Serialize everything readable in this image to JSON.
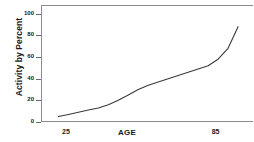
{
  "chart_data": {
    "type": "line",
    "title": "",
    "xlabel": "AGE",
    "ylabel": "Activity by Percent",
    "xlim": [
      15,
      100
    ],
    "ylim": [
      0,
      108
    ],
    "grid": false,
    "legend": null,
    "xticks": [
      {
        "value": 25,
        "label": "25"
      },
      {
        "value": 85,
        "label": "85"
      }
    ],
    "yticks": [
      {
        "value": 0,
        "label": "0"
      },
      {
        "value": 20,
        "label": "20"
      },
      {
        "value": 40,
        "label": "40"
      },
      {
        "value": 60,
        "label": "60"
      },
      {
        "value": 80,
        "label": "80"
      },
      {
        "value": 100,
        "label": "100"
      }
    ],
    "series": [
      {
        "name": "Activity by Percent",
        "color": "#3a3a3a",
        "x": [
          22,
          26,
          30,
          34,
          38,
          42,
          46,
          50,
          54,
          58,
          62,
          66,
          70,
          74,
          78,
          82,
          86,
          90,
          94
        ],
        "values": [
          5,
          7,
          9,
          11,
          13,
          16,
          20,
          25,
          30,
          34,
          37,
          40,
          43,
          46,
          49,
          52,
          58,
          68,
          88
        ]
      }
    ]
  },
  "axis": {
    "y_title": "Activity by Percent",
    "x_title": "AGE",
    "y_tick_labels": [
      "100",
      "80",
      "60",
      "40",
      "20",
      "0"
    ],
    "x_tick_labels": [
      "25",
      "85"
    ]
  },
  "style": {
    "line_color": "#3a3a3a",
    "frame_color": "#8d8d8d",
    "text_color": "#1a1a1a",
    "background": "#ffffff"
  }
}
